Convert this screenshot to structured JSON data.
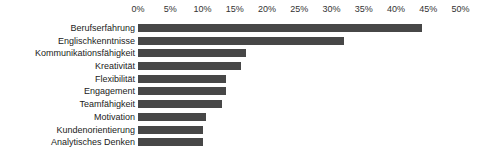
{
  "chart_data": {
    "type": "bar",
    "orientation": "horizontal",
    "title": "",
    "subtitle": "",
    "xlabel": "",
    "ylabel": "",
    "xlim": [
      0,
      50
    ],
    "grid": false,
    "legend": null,
    "legend_position": "none",
    "value_suffix": "%",
    "categories": [
      "Berufserfahrung",
      "Englischkenntnisse",
      "Kommunikationsfähigkeit",
      "Kreativität",
      "Flexibilität",
      "Engagement",
      "Teamfähigkeit",
      "Motivation",
      "Kundenorientierung",
      "Analytisches Denken"
    ],
    "values": [
      44,
      32,
      16.8,
      16,
      13.6,
      13.6,
      13,
      10.5,
      10,
      10
    ],
    "tick_labels": [
      "0%",
      "5%",
      "10%",
      "15%",
      "20%",
      "25%",
      "30%",
      "35%",
      "40%",
      "45%",
      "50%"
    ],
    "tick_values": [
      0,
      5,
      10,
      15,
      20,
      25,
      30,
      35,
      40,
      45,
      50
    ],
    "bar_color": "#474747",
    "background_color": "#ffffff",
    "text_color": "#222222"
  }
}
